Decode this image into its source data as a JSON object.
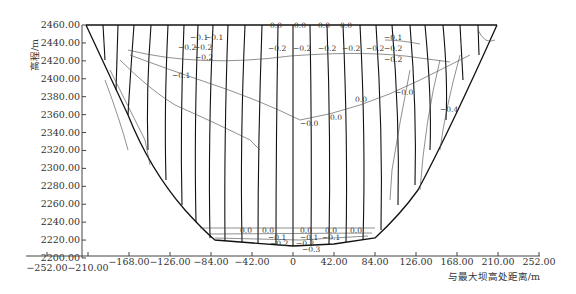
{
  "chart_data": {
    "type": "line",
    "title": "",
    "xlabel": "与最大坝高处距离/m",
    "ylabel": "高程/m",
    "xlim": [
      -252,
      252
    ],
    "ylim": [
      2200,
      2460
    ],
    "x_ticks": [
      "-252.00",
      "-210.00",
      "-168.00",
      "-126.00",
      "-84.00",
      "-42.00",
      "0",
      "42.00",
      "84.00",
      "126.00",
      "168.00",
      "210.00",
      "252.00"
    ],
    "y_ticks": [
      "2200.00",
      "2220.00",
      "2240.00",
      "2260.00",
      "2280.00",
      "2300.00",
      "2320.00",
      "2340.00",
      "2360.00",
      "2380.00",
      "2400.00",
      "2420.00",
      "2440.00",
      "2460.00"
    ],
    "grid": false,
    "legend": null,
    "dam_profile": {
      "crest_elevation": 2460,
      "crest_x_range": [
        -212,
        209
      ],
      "lowest_elevation": 2217,
      "boundary_points": [
        [
          -212,
          2460
        ],
        [
          -170,
          2360
        ],
        [
          -140,
          2300
        ],
        [
          -84,
          2240
        ],
        [
          -42,
          2224
        ],
        [
          0,
          2218
        ],
        [
          42,
          2222
        ],
        [
          84,
          2226
        ],
        [
          126,
          2270
        ],
        [
          168,
          2360
        ],
        [
          209,
          2460
        ]
      ]
    },
    "contour_levels": [
      "-0.4",
      "-0.3",
      "-0.2",
      "-0.1",
      "0.0",
      "0.1",
      "0.2",
      "0.3",
      "0.4"
    ],
    "contour_labels_visible": [
      "-0.1",
      "-0.2",
      "0.0",
      "0.1",
      "0.2",
      "0.3",
      "-0.3",
      "-0.4"
    ],
    "annotations": {
      "top_row": [
        "0.1",
        "0.1",
        "0.2",
        "0.2",
        "0.2",
        "0.0",
        "0.0",
        "0.0",
        "0.0",
        "0.2",
        "0.2",
        "0.2",
        "0.2",
        "0.2",
        "0.2",
        "0.1",
        "0.2"
      ],
      "bottom_row": [
        "0.0",
        "0.0",
        "0.0",
        "0.0",
        "0.0",
        "0.1",
        "0.1",
        "0.1",
        "0.2",
        "0.2",
        "0.3"
      ]
    }
  },
  "axes": {
    "xlabel": "与最大坝高处距离/m",
    "ylabel": "高程/m"
  }
}
